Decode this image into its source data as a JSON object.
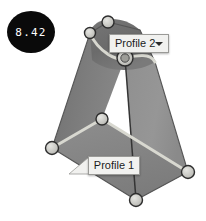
{
  "viewport": {
    "background_color": "#ffffff",
    "width": 206,
    "height": 221
  },
  "badge": {
    "value": "8.42",
    "background_color": "#0a0a0a",
    "text_color": "#ffffff"
  },
  "labels": {
    "profile2": {
      "text": "Profile 2",
      "has_dropdown": true,
      "dropdown_icon": "chevron-down-icon"
    },
    "profile1": {
      "text": "Profile 1",
      "has_dropdown": false
    }
  },
  "model": {
    "name": "loft-solid",
    "colors": {
      "face_left": "#7b7b7b",
      "face_right": "#8f8f8f",
      "face_bottom": "#848484",
      "cap_top": "#6e6e6e",
      "cap_top_highlight": "#a5a5a5",
      "profile_curve": "#d6d6cf",
      "silhouette_edge": "#5a5a5a",
      "vertical_edge": "#3a3a3a",
      "handle_fill": "#c9c9c4",
      "handle_stroke": "#2e2e2e"
    },
    "faces": [
      {
        "name": "face-left",
        "points": "90,33 108,22 125,58 102,119 52,148"
      },
      {
        "name": "face-right",
        "points": "108,22 140,30 155,62 188,172 136,200 125,58"
      },
      {
        "name": "face-bottom",
        "points": "52,148 102,119 188,172 136,200"
      }
    ],
    "cap": {
      "name": "cap-top-dome",
      "path": "M 90,33 C 92,18 120,12 140,30 L 155,62 C 140,72 108,74 92,60 Z"
    },
    "profile_curves": [
      {
        "name": "profile-2-curve",
        "path": "M 90,33 C 98,52 118,62 125,58 C 138,55 150,52 155,62"
      },
      {
        "name": "profile-1-polyline",
        "path": "M 52,148 L 102,119 L 188,172"
      }
    ],
    "edges": [
      {
        "name": "edge-left-silhouette",
        "path": "M 90,33 L 52,148"
      },
      {
        "name": "edge-right-silhouette",
        "path": "M 155,62 L 188,172"
      },
      {
        "name": "edge-top-left",
        "path": "M 90,33 L 108,22"
      },
      {
        "name": "edge-bottom-left",
        "path": "M 52,148 L 136,200"
      },
      {
        "name": "edge-bottom-right",
        "path": "M 136,200 L 188,172"
      },
      {
        "name": "edge-vertical-center",
        "path": "M 125,58 L 136,200"
      }
    ],
    "handles": [
      {
        "name": "vertex-handle-top",
        "cx": 108,
        "cy": 22,
        "r": 6.0
      },
      {
        "name": "vertex-handle-upper-left",
        "cx": 90,
        "cy": 33,
        "r": 5.5
      },
      {
        "name": "vertex-handle-profile2-mid",
        "cx": 125,
        "cy": 58,
        "r": 8.0
      },
      {
        "name": "vertex-handle-profile1-mid",
        "cx": 102,
        "cy": 119,
        "r": 6.0
      },
      {
        "name": "vertex-handle-left",
        "cx": 52,
        "cy": 148,
        "r": 6.5
      },
      {
        "name": "vertex-handle-right",
        "cx": 188,
        "cy": 172,
        "r": 6.5
      },
      {
        "name": "vertex-handle-bottom",
        "cx": 136,
        "cy": 200,
        "r": 6.5
      }
    ]
  }
}
